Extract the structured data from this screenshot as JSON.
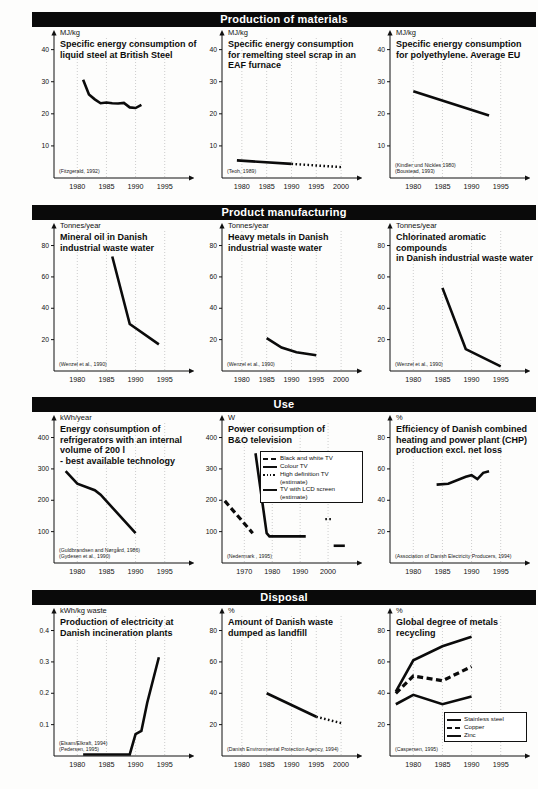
{
  "figure": {
    "sections": [
      {
        "id": "production-of-materials",
        "label": "Production of materials",
        "charts": [
          {
            "id": "liquid-steel",
            "unit": "MJ/kg",
            "title": "Specific energy consumption of\nliquid steel at British Steel",
            "citation": "(Fitzgerald, 1992)",
            "yticks": [
              "40",
              "30",
              "20",
              "10"
            ],
            "xticks": [
              "1980",
              "1985",
              "1990",
              "1995"
            ]
          },
          {
            "id": "eaf-steel-scrap",
            "unit": "MJ/kg",
            "title": "Specific energy consumption\nfor remelting steel scrap in an\nEAF furnace",
            "citation": "(Teoh, 1989)",
            "yticks": [
              "40",
              "30",
              "20",
              "10"
            ],
            "xticks": [
              "1980",
              "1985",
              "1990",
              "1995",
              "2000"
            ]
          },
          {
            "id": "polyethylene",
            "unit": "MJ/kg",
            "title": "Specific energy consumption\nfor polyethylene. Average EU",
            "citation": "(Kindler und Nickles 1980)\n(Boustead, 1993)",
            "yticks": [
              "40",
              "30",
              "20",
              "10"
            ],
            "xticks": [
              "1980",
              "1985",
              "1990",
              "1995"
            ]
          }
        ]
      },
      {
        "id": "product-manufacturing",
        "label": "Product manufacturing",
        "charts": [
          {
            "id": "mineral-oil",
            "unit": "Tonnes/year",
            "title": "Mineral oil in Danish\nindustrial waste water",
            "citation": "(Wenzel et al., 1990)",
            "yticks": [
              "80",
              "60",
              "40",
              "20"
            ],
            "xticks": [
              "1980",
              "1985",
              "1990",
              "1995"
            ]
          },
          {
            "id": "heavy-metals",
            "unit": "Tonnes/year",
            "title": "Heavy metals in Danish\nindustrial waste water",
            "citation": "(Wenzel et al., 1990)",
            "yticks": [
              "80",
              "60",
              "40",
              "20"
            ],
            "xticks": [
              "1980",
              "1985",
              "1990",
              "1995",
              "2000"
            ]
          },
          {
            "id": "chlorinated-aromatics",
            "unit": "Tonnes/year",
            "title": "Chlorinated aromatic compounds\nin Danish industrial waste water",
            "citation": "(Wenzel et al., 1990)",
            "yticks": [
              "80",
              "60",
              "40",
              "20"
            ],
            "xticks": [
              "1980",
              "1985",
              "1990",
              "1995"
            ]
          }
        ]
      },
      {
        "id": "use",
        "label": "Use",
        "charts": [
          {
            "id": "refrigerators",
            "unit": "kWh/year",
            "title": "Energy consumption of\nrefrigerators with an internal\nvolume of 200 l\n- best available technology",
            "citation": "(Guldbrandsen and Nørgård, 1986)\n(Gydesen et al., 1990)",
            "yticks": [
              "400",
              "300",
              "200",
              "100"
            ],
            "xticks": [
              "1980",
              "1985",
              "1990",
              "1995"
            ]
          },
          {
            "id": "bo-television",
            "unit": "W",
            "title": "Power consumption of\nB&O television",
            "citation": "(Nedermark , 1995)",
            "yticks": [
              "400",
              "300",
              "200",
              "100"
            ],
            "xticks": [
              "1970",
              "1980",
              "1990",
              "2000"
            ],
            "legend": [
              {
                "key": "dashed",
                "text": "Black and white TV"
              },
              {
                "key": "solid",
                "text": "Colour TV"
              },
              {
                "key": "dotted",
                "text": "High definition TV\n(estimate)"
              },
              {
                "key": "solid",
                "text": "TV with LCD screen\n(estimate)"
              }
            ]
          },
          {
            "id": "chp-efficiency",
            "unit": "%",
            "title": "Efficiency of Danish combined\nheating and power plant (CHP)\nproduction excl. net loss",
            "citation": "(Association of Danish Electricity Producers, 1994)",
            "yticks": [
              "80",
              "60",
              "40",
              "20"
            ],
            "xticks": [
              "1980",
              "1985",
              "1990",
              "1995"
            ]
          }
        ]
      },
      {
        "id": "disposal",
        "label": "Disposal",
        "charts": [
          {
            "id": "incineration-electricity",
            "unit": "kWh/kg waste",
            "title": "Production of electricity at\nDanish incineration plants",
            "citation": "(Elsam/Elkraft, 1994)\n(Pedersen, 1995)",
            "yticks": [
              "0.4",
              "0.3",
              "0.2",
              "0.1"
            ],
            "xticks": [
              "1980",
              "1985",
              "1990",
              "1995"
            ]
          },
          {
            "id": "landfill",
            "unit": "%",
            "title": "Amount of Danish waste\ndumped as landfill",
            "citation": "(Danish Environmental Protection Agency, 1994)",
            "yticks": [
              "80",
              "60",
              "40",
              "20"
            ],
            "xticks": [
              "1980",
              "1985",
              "1990",
              "1995",
              "2000"
            ]
          },
          {
            "id": "metals-recycling",
            "unit": "%",
            "title": "Global degree of metals\nrecycling",
            "citation": "(Caspersen, 1995)",
            "yticks": [
              "80",
              "60",
              "40",
              "20"
            ],
            "xticks": [
              "1980",
              "1985",
              "1990",
              "1995"
            ],
            "legend": [
              {
                "key": "solid",
                "text": "Stainless steel"
              },
              {
                "key": "dashed",
                "text": "Copper"
              },
              {
                "key": "solid",
                "text": "Zinc"
              }
            ]
          }
        ]
      }
    ]
  },
  "chart_data": [
    {
      "id": "liquid-steel",
      "type": "line",
      "title": "Specific energy consumption of liquid steel at British Steel",
      "xlabel": "",
      "ylabel": "MJ/kg",
      "unit": "MJ/kg",
      "xlim": [
        1976,
        1999
      ],
      "ylim": [
        0,
        43
      ],
      "grid": true,
      "annotations": [
        "(Fitzgerald, 1992)"
      ],
      "series": [
        {
          "name": "Liquid steel",
          "style": "solid",
          "x": [
            1981,
            1982,
            1983,
            1984,
            1985,
            1986,
            1987,
            1988,
            1989,
            1990,
            1991
          ],
          "y": [
            30.6,
            26.0,
            24.5,
            23.3,
            23.5,
            23.3,
            23.2,
            23.4,
            22.0,
            21.8,
            22.8
          ]
        }
      ]
    },
    {
      "id": "eaf-steel-scrap",
      "type": "line",
      "title": "Specific energy consumption for remelting steel scrap in an EAF furnace",
      "xlabel": "",
      "ylabel": "MJ/kg",
      "unit": "MJ/kg",
      "xlim": [
        1976,
        2003
      ],
      "ylim": [
        0,
        43
      ],
      "grid": true,
      "annotations": [
        "(Teoh, 1989)"
      ],
      "series": [
        {
          "name": "EAF measured",
          "style": "solid",
          "x": [
            1979,
            1990
          ],
          "y": [
            5.5,
            4.4
          ]
        },
        {
          "name": "EAF projected",
          "style": "dotted",
          "x": [
            1990,
            2000
          ],
          "y": [
            4.4,
            3.4
          ]
        }
      ]
    },
    {
      "id": "polyethylene",
      "type": "line",
      "title": "Specific energy consumption for polyethylene. Average EU",
      "xlabel": "",
      "ylabel": "MJ/kg",
      "unit": "MJ/kg",
      "xlim": [
        1976,
        1999
      ],
      "ylim": [
        0,
        43
      ],
      "grid": true,
      "annotations": [
        "(Kindler und Nickles 1980)",
        "(Boustead, 1993)"
      ],
      "series": [
        {
          "name": "Polyethylene",
          "style": "solid",
          "x": [
            1980,
            1993
          ],
          "y": [
            27.0,
            19.5
          ]
        }
      ]
    },
    {
      "id": "mineral-oil",
      "type": "line",
      "title": "Mineral oil in Danish industrial waste water",
      "xlabel": "",
      "ylabel": "Tonnes/year",
      "unit": "Tonnes/year",
      "xlim": [
        1976,
        1999
      ],
      "ylim": [
        0,
        88
      ],
      "grid": true,
      "annotations": [
        "(Wenzel et al., 1990)"
      ],
      "series": [
        {
          "name": "Mineral oil",
          "style": "solid",
          "x": [
            1986,
            1989,
            1994
          ],
          "y": [
            73,
            30,
            17
          ]
        }
      ]
    },
    {
      "id": "heavy-metals",
      "type": "line",
      "title": "Heavy metals in Danish industrial waste water",
      "xlabel": "",
      "ylabel": "Tonnes/year",
      "unit": "Tonnes/year",
      "xlim": [
        1976,
        2003
      ],
      "ylim": [
        0,
        88
      ],
      "grid": true,
      "annotations": [
        "(Wenzel et al., 1990)"
      ],
      "series": [
        {
          "name": "Heavy metals",
          "style": "solid",
          "x": [
            1985,
            1988,
            1991,
            1995
          ],
          "y": [
            21,
            15,
            12,
            10
          ]
        }
      ]
    },
    {
      "id": "chlorinated-aromatics",
      "type": "line",
      "title": "Chlorinated aromatic compounds in Danish industrial waste water",
      "xlabel": "",
      "ylabel": "Tonnes/year",
      "unit": "Tonnes/year",
      "xlim": [
        1976,
        1999
      ],
      "ylim": [
        0,
        88
      ],
      "grid": true,
      "annotations": [
        "(Wenzel et al., 1990)"
      ],
      "series": [
        {
          "name": "Chlorinated aromatics",
          "style": "solid",
          "x": [
            1985,
            1989,
            1995
          ],
          "y": [
            53,
            14,
            3
          ]
        }
      ]
    },
    {
      "id": "refrigerators",
      "type": "line",
      "title": "Energy consumption of refrigerators with an internal volume of 200 l - best available technology",
      "xlabel": "",
      "ylabel": "kWh/year",
      "unit": "kWh/year",
      "xlim": [
        1976,
        1999
      ],
      "ylim": [
        0,
        440
      ],
      "grid": true,
      "annotations": [
        "(Guldbrandsen and Nørgård, 1986)",
        "(Gydesen et al., 1990)"
      ],
      "series": [
        {
          "name": "Refrigerator",
          "style": "solid",
          "x": [
            1978,
            1980,
            1983,
            1984,
            1990
          ],
          "y": [
            293,
            253,
            232,
            218,
            95
          ]
        }
      ]
    },
    {
      "id": "bo-television",
      "type": "line",
      "title": "Power consumption of B&O television",
      "xlabel": "",
      "ylabel": "W",
      "unit": "W",
      "xlim": [
        1962,
        2010
      ],
      "ylim": [
        0,
        440
      ],
      "grid": true,
      "annotations": [
        "(Nedermark , 1995)"
      ],
      "series": [
        {
          "name": "Black and white TV",
          "style": "dashed",
          "x": [
            1963,
            1973
          ],
          "y": [
            198,
            95
          ]
        },
        {
          "name": "Colour TV",
          "style": "solid",
          "x": [
            1974,
            1978,
            1979,
            1992
          ],
          "y": [
            350,
            95,
            85,
            85
          ]
        },
        {
          "name": "High definition TV (estimate)",
          "style": "dotted",
          "x": [
            1999,
            2001
          ],
          "y": [
            140,
            140
          ]
        },
        {
          "name": "TV with LCD screen (estimate)",
          "style": "solid",
          "x": [
            2002,
            2006
          ],
          "y": [
            55,
            55
          ]
        }
      ]
    },
    {
      "id": "chp-efficiency",
      "type": "line",
      "title": "Efficiency of Danish combined heating and power plant (CHP) production excl. net loss",
      "xlabel": "",
      "ylabel": "%",
      "unit": "%",
      "xlim": [
        1976,
        1999
      ],
      "ylim": [
        0,
        88
      ],
      "grid": true,
      "annotations": [
        "(Association of Danish Electricity Producers, 1994)"
      ],
      "series": [
        {
          "name": "CHP efficiency",
          "style": "solid",
          "x": [
            1984,
            1986,
            1989,
            1990,
            1991,
            1992,
            1993
          ],
          "y": [
            50,
            50.5,
            55,
            56,
            53.5,
            57.5,
            58.5
          ]
        }
      ]
    },
    {
      "id": "incineration-electricity",
      "type": "line",
      "title": "Production of electricity at Danish incineration plants",
      "xlabel": "",
      "ylabel": "kWh/kg waste",
      "unit": "kWh/kg waste",
      "xlim": [
        1976,
        1999
      ],
      "ylim": [
        0,
        0.44
      ],
      "grid": true,
      "annotations": [
        "(Elsam/Elkraft, 1994)",
        "(Pedersen, 1995)"
      ],
      "series": [
        {
          "name": "Electricity production",
          "style": "solid",
          "x": [
            1981,
            1989,
            1990,
            1991,
            1992,
            1994
          ],
          "y": [
            0.005,
            0.005,
            0.07,
            0.08,
            0.17,
            0.315
          ]
        }
      ]
    },
    {
      "id": "landfill",
      "type": "line",
      "title": "Amount of Danish waste dumped as landfill",
      "xlabel": "",
      "ylabel": "%",
      "unit": "%",
      "xlim": [
        1976,
        2003
      ],
      "ylim": [
        0,
        88
      ],
      "grid": true,
      "annotations": [
        "(Danish Environmental Protection Agency, 1994)"
      ],
      "series": [
        {
          "name": "Landfill measured",
          "style": "solid",
          "x": [
            1985,
            1995
          ],
          "y": [
            40,
            25
          ]
        },
        {
          "name": "Landfill projected",
          "style": "dotted",
          "x": [
            1995,
            2000
          ],
          "y": [
            25,
            21
          ]
        }
      ]
    },
    {
      "id": "metals-recycling",
      "type": "line",
      "title": "Global degree of metals recycling",
      "xlabel": "",
      "ylabel": "%",
      "unit": "%",
      "xlim": [
        1976,
        1999
      ],
      "ylim": [
        0,
        88
      ],
      "grid": true,
      "annotations": [
        "(Caspersen, 1995)"
      ],
      "series": [
        {
          "name": "Stainless steel",
          "style": "solid",
          "x": [
            1977,
            1980,
            1985,
            1990
          ],
          "y": [
            41,
            61,
            70,
            76
          ]
        },
        {
          "name": "Copper",
          "style": "dashed",
          "x": [
            1977,
            1980,
            1985,
            1990
          ],
          "y": [
            40,
            51,
            48,
            57
          ]
        },
        {
          "name": "Zinc",
          "style": "solid",
          "x": [
            1977,
            1980,
            1985,
            1990
          ],
          "y": [
            33,
            39,
            33,
            38
          ]
        }
      ]
    }
  ]
}
